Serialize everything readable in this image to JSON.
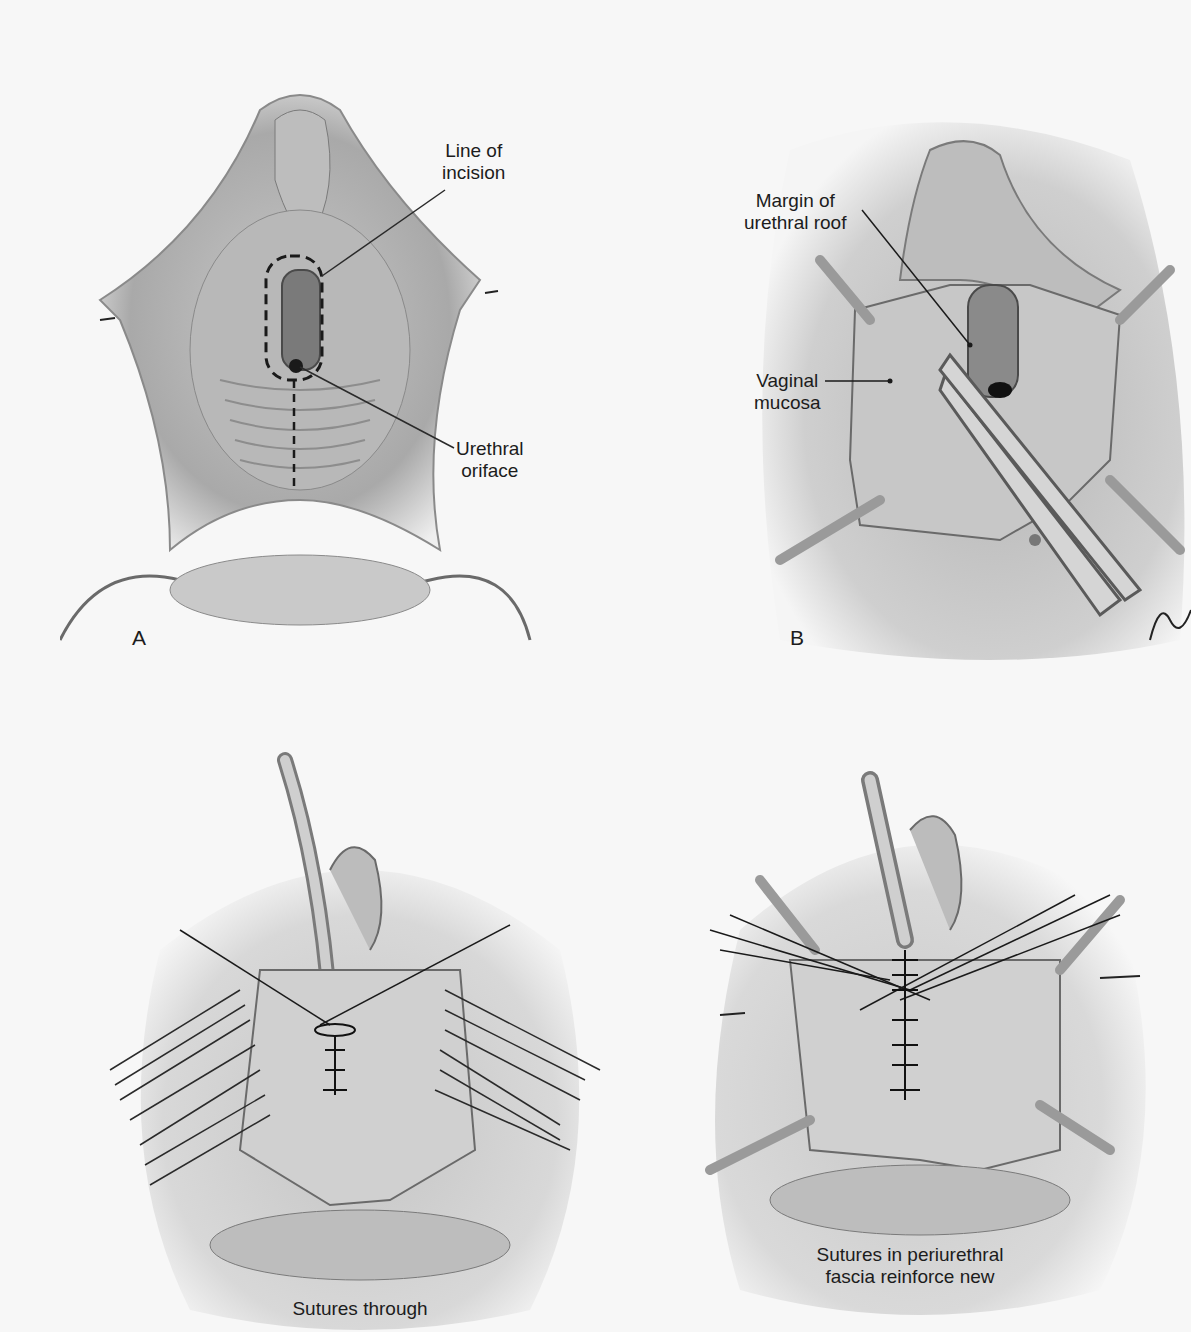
{
  "figure": {
    "panels": [
      {
        "id": "A",
        "letter": "A",
        "labels": {
          "line_of_incision": [
            "Line of",
            "incision"
          ],
          "urethral_oriface": [
            "Urethral",
            "oriface"
          ]
        }
      },
      {
        "id": "B",
        "letter": "B",
        "labels": {
          "margin_of_urethral_roof": [
            "Margin of",
            "urethral roof"
          ],
          "vaginal_mucosa": [
            "Vaginal",
            "mucosa"
          ]
        },
        "signature": "L.Bo..."
      },
      {
        "id": "C",
        "caption": [
          "Sutures through"
        ]
      },
      {
        "id": "D",
        "caption": [
          "Sutures in periurethral",
          "fascia reinforce new"
        ]
      }
    ],
    "colors": {
      "background": "#f7f7f7",
      "tissue_light": "#d9d9d9",
      "tissue_mid": "#a8a8a8",
      "tissue_dark": "#5a5a5a",
      "line": "#2a2a2a"
    }
  }
}
